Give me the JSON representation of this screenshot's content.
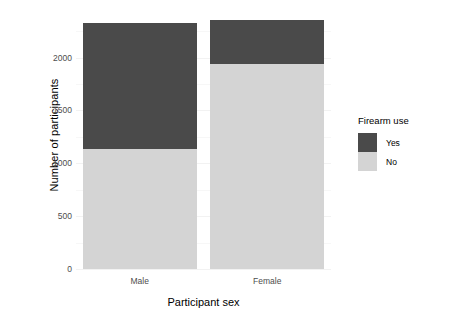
{
  "chart_data": {
    "type": "bar",
    "subtype": "stacked",
    "title": "",
    "xlabel": "Participant sex",
    "ylabel": "Number of participants",
    "categories": [
      "Male",
      "Female"
    ],
    "series": [
      {
        "name": "Yes",
        "values": [
          1187,
          417
        ],
        "color": "#4a4a4a"
      },
      {
        "name": "No",
        "values": [
          1137,
          1936
        ],
        "color": "#d4d4d4"
      }
    ],
    "stack_order_bottom_to_top": [
      "No",
      "Yes"
    ],
    "totals": [
      2324,
      2353
    ],
    "ylim": [
      0,
      2450
    ],
    "yticks": [
      0,
      500,
      1000,
      1500,
      2000
    ],
    "ytick_labels": [
      "0",
      "500",
      "1000",
      "1500",
      "2000"
    ],
    "grid": true,
    "legend": {
      "title": "Firearm use",
      "position": "right",
      "entries": [
        {
          "label": "Yes",
          "color": "#4a4a4a"
        },
        {
          "label": "No",
          "color": "#d4d4d4"
        }
      ]
    },
    "background": "#ffffff",
    "axis_text_color": "#4d4d4d"
  }
}
